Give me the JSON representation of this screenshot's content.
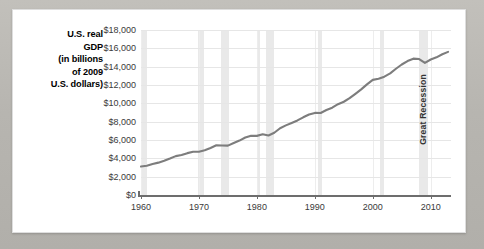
{
  "chart_data": {
    "type": "line",
    "title": "",
    "ylabel": "U.S. real GDP (in billions of 2009 U.S. dollars)",
    "ylabel_lines": [
      "U.S. real",
      "GDP",
      "(in billions",
      "of 2009",
      "U.S. dollars)"
    ],
    "xlabel": "",
    "xlim": [
      1960,
      2013.5
    ],
    "ylim": [
      0,
      18000
    ],
    "grid": true,
    "legend": false,
    "line_color": "#7d7d7d",
    "recession_band_color": "#e9e9e9",
    "y_ticks": [
      0,
      2000,
      4000,
      6000,
      8000,
      10000,
      12000,
      14000,
      16000,
      18000
    ],
    "y_tick_labels": [
      "$0",
      "$2,000",
      "$4,000",
      "$6,000",
      "$8,000",
      "$10,000",
      "$12,000",
      "$14,000",
      "$16,000",
      "$18,000"
    ],
    "x_ticks": [
      1960,
      1970,
      1980,
      1990,
      2000,
      2010
    ],
    "x_tick_labels": [
      "1960",
      "1970",
      "1980",
      "1990",
      "2000",
      "2010"
    ],
    "annotations": [
      {
        "text": "Great Recession",
        "x_start": 2007.9,
        "x_end": 2009.5,
        "orientation": "vertical"
      }
    ],
    "recession_bands": [
      {
        "start": 1960.2,
        "end": 1961.1
      },
      {
        "start": 1969.9,
        "end": 1970.8
      },
      {
        "start": 1973.8,
        "end": 1975.2
      },
      {
        "start": 1980.0,
        "end": 1980.5
      },
      {
        "start": 1981.5,
        "end": 1982.9
      },
      {
        "start": 1990.5,
        "end": 1991.2
      },
      {
        "start": 2001.2,
        "end": 2001.9
      },
      {
        "start": 2007.9,
        "end": 2009.5
      }
    ],
    "x": [
      1960,
      1961,
      1962,
      1963,
      1964,
      1965,
      1966,
      1967,
      1968,
      1969,
      1970,
      1971,
      1972,
      1973,
      1974,
      1975,
      1976,
      1977,
      1978,
      1979,
      1980,
      1981,
      1982,
      1983,
      1984,
      1985,
      1986,
      1987,
      1988,
      1989,
      1990,
      1991,
      1992,
      1993,
      1994,
      1995,
      1996,
      1997,
      1998,
      1999,
      2000,
      2001,
      2002,
      2003,
      2004,
      2005,
      2006,
      2007,
      2008,
      2009,
      2010,
      2011,
      2012,
      2013
    ],
    "values": [
      3108,
      3189,
      3384,
      3531,
      3734,
      3976,
      4238,
      4356,
      4567,
      4712,
      4722,
      4878,
      5134,
      5424,
      5396,
      5385,
      5675,
      5937,
      6267,
      6466,
      6450,
      6618,
      6491,
      6792,
      7285,
      7594,
      7861,
      8133,
      8475,
      8786,
      8955,
      8948,
      9267,
      9521,
      9906,
      10175,
      10561,
      11035,
      11526,
      12066,
      12560,
      12682,
      12909,
      13271,
      13774,
      14234,
      14614,
      14874,
      14830,
      14419,
      14784,
      15021,
      15355,
      15612
    ],
    "series_name": "U.S. real GDP",
    "units": "billions of chained 2009 U.S. dollars",
    "data_point_count": 54
  }
}
